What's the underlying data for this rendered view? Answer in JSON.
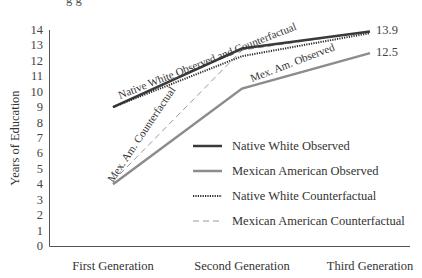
{
  "chart_data": {
    "type": "line",
    "title": "",
    "xlabel": "",
    "ylabel": "Years of Education",
    "categories": [
      "First Generation",
      "Second Generation",
      "Third Generation"
    ],
    "ylim": [
      0,
      14
    ],
    "yticks": [
      0,
      1,
      2,
      3,
      4,
      5,
      6,
      7,
      8,
      9,
      10,
      11,
      12,
      13,
      14
    ],
    "grid": false,
    "legend_position": "inside-right",
    "series": [
      {
        "name": "Native White Observed",
        "values": [
          9.0,
          12.8,
          13.9
        ],
        "color": "#3a3a3a",
        "style": "solid",
        "width": 2.5
      },
      {
        "name": "Mexican American Observed",
        "values": [
          4.0,
          10.2,
          12.5
        ],
        "color": "#8c8c8c",
        "style": "solid",
        "width": 2.5
      },
      {
        "name": "Native White Counterfactual",
        "values": [
          9.0,
          12.3,
          13.8
        ],
        "color": "#2a2a2a",
        "style": "dotted",
        "width": 2
      },
      {
        "name": "Mexican American Counterfactual",
        "values": [
          4.2,
          12.7,
          13.9
        ],
        "color": "#9a9a9a",
        "style": "dashed",
        "width": 1
      }
    ],
    "annotations": [
      {
        "text": "Native White Observed and Counterfactual",
        "position": "along upper lines, first to second generation"
      },
      {
        "text": "Mex. Am. Counterfactual",
        "position": "along dashed line near first generation"
      },
      {
        "text": "Mex. Am. Observed",
        "position": "along lower line, second to third generation"
      },
      {
        "text": "13.9",
        "position": "end of Native White lines"
      },
      {
        "text": "12.5",
        "position": "end of Mexican American Observed line"
      }
    ]
  },
  "labels": {
    "cut_title": "g    g",
    "ann_nw": "Native White Observed and Counterfactual",
    "ann_mex_cf": "Mex. Am. Counterfactual",
    "ann_mex_obs": "Mex. Am. Observed",
    "end_nw": "13.9",
    "end_mex": "12.5"
  }
}
